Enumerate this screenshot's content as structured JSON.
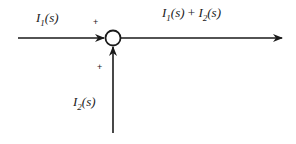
{
  "diagram": {
    "type": "summing-junction",
    "inputs": [
      {
        "name": "I",
        "subscript": "1",
        "suffix": "(s)",
        "sign": "+",
        "direction": "from-left"
      },
      {
        "name": "I",
        "subscript": "2",
        "suffix": "(s)",
        "sign": "+",
        "direction": "from-below"
      }
    ],
    "output": {
      "parts": [
        {
          "name": "I",
          "subscript": "1",
          "suffix": "(s)"
        },
        {
          "operator": " + "
        },
        {
          "name": "I",
          "subscript": "2",
          "suffix": "(s)"
        }
      ],
      "direction": "to-right"
    }
  }
}
